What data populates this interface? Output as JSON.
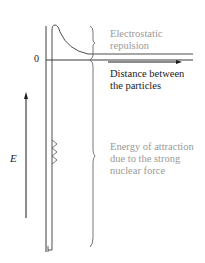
{
  "diagram": {
    "title": "",
    "axis": {
      "zero_label": "0",
      "y_label": "E",
      "x_label_line1": "Distance between",
      "x_label_line2": "the particles"
    },
    "annotations": {
      "repulsion_line1": "Electrostatic",
      "repulsion_line2": "repulsion",
      "attraction_line1": "Energy of attraction",
      "attraction_line2": "due to the strong",
      "attraction_line3": "nuclear force"
    },
    "colors": {
      "line": "#3a3a3a",
      "annotation_text": "#9a9a9a",
      "label_text": "#1a1a1a",
      "background": "#ffffff"
    }
  }
}
